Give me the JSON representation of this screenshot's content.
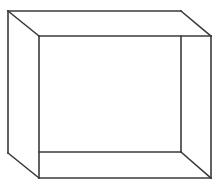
{
  "diagram": {
    "type": "open-box-line-drawing",
    "stroke_color": "#3a3a3a",
    "background": "#ffffff",
    "stroke_width": 1.6,
    "edges": [
      {
        "name": "outer-top-edge",
        "x1": 8,
        "y1": 11,
        "x2": 181,
        "y2": 11
      },
      {
        "name": "top-right-diagonal",
        "x1": 181,
        "y1": 11,
        "x2": 211,
        "y2": 36
      },
      {
        "name": "top-left-diagonal",
        "x1": 8,
        "y1": 11,
        "x2": 39,
        "y2": 36
      },
      {
        "name": "inner-top-edge",
        "x1": 39,
        "y1": 36,
        "x2": 211,
        "y2": 36
      },
      {
        "name": "outer-left-edge",
        "x1": 8,
        "y1": 11,
        "x2": 8,
        "y2": 153
      },
      {
        "name": "inner-left-edge",
        "x1": 39,
        "y1": 36,
        "x2": 39,
        "y2": 178
      },
      {
        "name": "inner-right-edge",
        "x1": 181,
        "y1": 36,
        "x2": 181,
        "y2": 152
      },
      {
        "name": "outer-right-edge",
        "x1": 211,
        "y1": 36,
        "x2": 211,
        "y2": 178
      },
      {
        "name": "inner-bottom-edge",
        "x1": 39,
        "y1": 152,
        "x2": 181,
        "y2": 152
      },
      {
        "name": "bottom-right-diagonal",
        "x1": 181,
        "y1": 152,
        "x2": 211,
        "y2": 178
      },
      {
        "name": "bottom-left-diagonal",
        "x1": 8,
        "y1": 153,
        "x2": 39,
        "y2": 178
      },
      {
        "name": "outer-bottom-edge",
        "x1": 39,
        "y1": 178,
        "x2": 211,
        "y2": 178
      }
    ]
  }
}
